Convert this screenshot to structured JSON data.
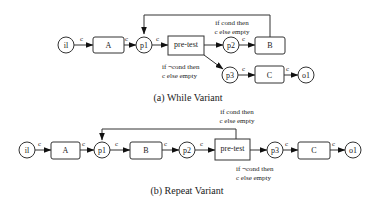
{
  "diagrams": [
    {
      "caption": "(a) While Variant",
      "nodes": [
        {
          "id": "il",
          "type": "place",
          "label": "il"
        },
        {
          "id": "A",
          "type": "transition",
          "label": "A"
        },
        {
          "id": "p1",
          "type": "place",
          "label": "p1"
        },
        {
          "id": "pretest",
          "type": "transition",
          "label": "pre-test"
        },
        {
          "id": "p2",
          "type": "place",
          "label": "p2"
        },
        {
          "id": "B",
          "type": "transition",
          "label": "B"
        },
        {
          "id": "p3",
          "type": "place",
          "label": "p3"
        },
        {
          "id": "C",
          "type": "transition",
          "label": "C"
        },
        {
          "id": "o1",
          "type": "place",
          "label": "o1"
        }
      ],
      "arc_label": "c",
      "cond_true": [
        "if cond then",
        "c else empty"
      ],
      "cond_false": [
        "if ¬cond then",
        "c else empty"
      ]
    },
    {
      "caption": "(b) Repeat Variant",
      "nodes": [
        {
          "id": "il",
          "type": "place",
          "label": "il"
        },
        {
          "id": "A",
          "type": "transition",
          "label": "A"
        },
        {
          "id": "p1",
          "type": "place",
          "label": "p1"
        },
        {
          "id": "B",
          "type": "transition",
          "label": "B"
        },
        {
          "id": "p2",
          "type": "place",
          "label": "p2"
        },
        {
          "id": "pretest",
          "type": "transition",
          "label": "pre-test"
        },
        {
          "id": "p3",
          "type": "place",
          "label": "p3"
        },
        {
          "id": "C",
          "type": "transition",
          "label": "C"
        },
        {
          "id": "o1",
          "type": "place",
          "label": "o1"
        }
      ],
      "arc_label": "c",
      "cond_true": [
        "if cond then",
        "c else empty"
      ],
      "cond_false": [
        "if ¬cond then",
        "c else empty"
      ]
    }
  ]
}
